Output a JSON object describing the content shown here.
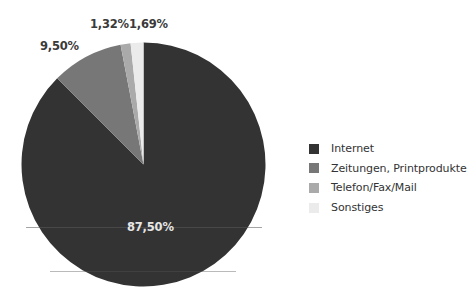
{
  "chart_data": {
    "type": "pie",
    "title": "",
    "start_angle_deg": 0,
    "direction": "clockwise",
    "categories": [
      "Internet",
      "Zeitungen, Printprodukte",
      "Telefon/Fax/Mail",
      "Sonstiges"
    ],
    "values": [
      87.5,
      9.5,
      1.32,
      1.69
    ],
    "labels": [
      "87,50%",
      "9,50%",
      "1,32%",
      "1,69%"
    ],
    "colors": [
      "#333333",
      "#777777",
      "#aaaaaa",
      "#ebebeb"
    ],
    "unit": "%",
    "legend_position": "right"
  },
  "pie": {
    "center": [
      143.5,
      164.5
    ],
    "radius": 122
  },
  "labels": [
    {
      "text": "87,50%",
      "x": 127,
      "y": 220,
      "inside": true
    },
    {
      "text": "9,50%",
      "x": 40,
      "y": 39,
      "inside": false
    },
    {
      "text": "1,32%",
      "x": 90,
      "y": 17,
      "inside": false
    },
    {
      "text": "1,69%",
      "x": 129,
      "y": 17,
      "inside": false
    }
  ],
  "legend": {
    "items": [
      {
        "label": "Internet",
        "color": "#333333"
      },
      {
        "label": "Zeitungen, Printprodukte",
        "color": "#777777"
      },
      {
        "label": "Telefon/Fax/Mail",
        "color": "#aaaaaa"
      },
      {
        "label": "Sonstiges",
        "color": "#ebebeb"
      }
    ]
  }
}
